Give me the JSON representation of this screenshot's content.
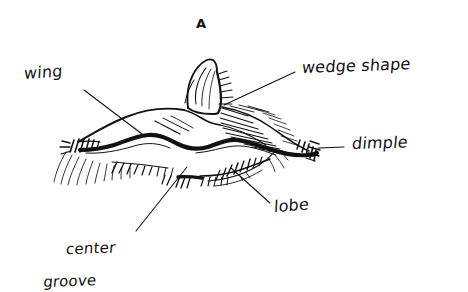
{
  "figure": {
    "title": "A",
    "medium": "hand-drawn ink sketch",
    "background_color": "#ffffff",
    "ink_color": "#121212"
  },
  "labels": {
    "title": "A",
    "wing": "wing",
    "wedge_shape": "wedge shape",
    "dimple": "dimple",
    "lobe": "lobe",
    "center_groove_line1": "center",
    "center_groove_line2": "groove"
  },
  "annotations": [
    {
      "name": "wing",
      "text": "wing",
      "label_x": 24,
      "label_y": 68,
      "leader": {
        "x1": 84,
        "y1": 90,
        "x2": 142,
        "y2": 134
      }
    },
    {
      "name": "wedge-shape",
      "text": "wedge shape",
      "label_x": 302,
      "label_y": 62,
      "leader": {
        "x1": 295,
        "y1": 72,
        "x2": 224,
        "y2": 105
      }
    },
    {
      "name": "dimple",
      "text": "dimple",
      "label_x": 352,
      "label_y": 137,
      "leader": {
        "x1": 344,
        "y1": 147,
        "x2": 318,
        "y2": 148
      }
    },
    {
      "name": "lobe",
      "text": "lobe",
      "label_x": 272,
      "label_y": 200,
      "leader": {
        "x1": 270,
        "y1": 203,
        "x2": 231,
        "y2": 168
      }
    },
    {
      "name": "center-groove",
      "text": "center groove",
      "label_x": 44,
      "label_y": 230,
      "leader": {
        "x1": 136,
        "y1": 231,
        "x2": 187,
        "y2": 167
      }
    }
  ]
}
